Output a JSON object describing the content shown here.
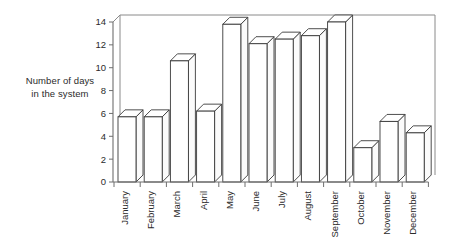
{
  "chart_data": {
    "type": "bar",
    "title": "",
    "subtitle": "",
    "xlabel": "",
    "ylabel": "Number of days in the system",
    "ylabel_line1": "Number of days",
    "ylabel_line2": "in the system",
    "categories": [
      "January",
      "February",
      "March",
      "April",
      "May",
      "June",
      "July",
      "August",
      "September",
      "October",
      "November",
      "December"
    ],
    "values": [
      5.7,
      5.7,
      10.6,
      6.2,
      13.8,
      12.1,
      12.5,
      12.8,
      14.0,
      3.0,
      5.3,
      4.3
    ],
    "ylim": [
      0,
      14
    ],
    "ytick_values": [
      0,
      2,
      4,
      6,
      8,
      10,
      12,
      14
    ],
    "ytick_labels": [
      "0",
      "2",
      "4",
      "6",
      "8",
      "10",
      "12",
      "14"
    ],
    "grid": false,
    "legend": false,
    "legend_position": "none",
    "style": "3d-isometric-outline",
    "bar_fill_color": "#ffffff",
    "bar_outline_color": "#3a3a3a",
    "frame_color": "#8a8a8a",
    "axis_color": "#6e6e6e",
    "text_color": "#2b2b2b",
    "category_label_rotation": -90
  },
  "axis": {
    "y_title_line1": "Number of days",
    "y_title_line2": "in the system"
  }
}
